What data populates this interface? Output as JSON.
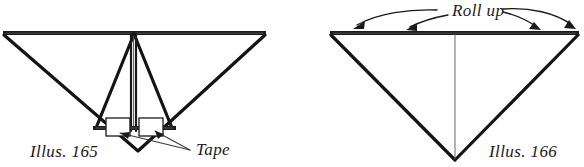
{
  "page": {
    "background_color": "#ffffff",
    "ink_color": "#1a1a1a",
    "width": 584,
    "height": 167
  },
  "figures": [
    {
      "id": "illus-165",
      "caption": "Illus. 165",
      "caption_x": 30,
      "caption_y": 157,
      "callout": {
        "label": "Tape",
        "label_x": 196,
        "label_y": 155
      },
      "parts": {
        "outer_triangle": "wide inverted triangle",
        "inner_triangle": "narrow inverted triangle",
        "rolled_tube": "vertical rolled tube at center",
        "tape_pieces": 2,
        "crossbar": "horizontal bar near bottom"
      }
    },
    {
      "id": "illus-166",
      "caption": "Illus. 166",
      "caption_x": 489,
      "caption_y": 157,
      "callout": {
        "label": "Roll up",
        "label_x": 452,
        "label_y": 14
      },
      "parts": {
        "outer_triangle": "inverted triangle",
        "center_fold": "vertical center fold line",
        "arrows": 4
      }
    }
  ],
  "labels": {
    "illus_165": "Illus. 165",
    "illus_166": "Illus. 166",
    "tape": "Tape",
    "roll_up": "Roll up"
  },
  "colors": {
    "ink": "#1a1a1a",
    "heavy_ink": "#141414",
    "thin_ink": "#3a3a3a",
    "paper": "#ffffff"
  }
}
